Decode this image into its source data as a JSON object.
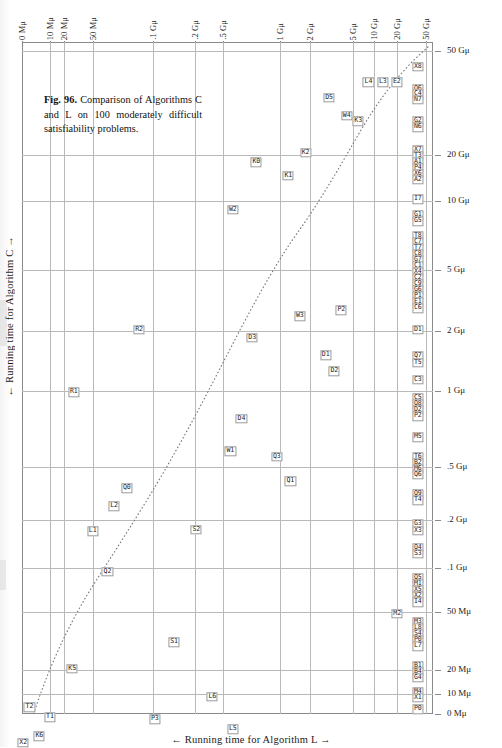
{
  "figure": {
    "caption_label": "Fig. 96.",
    "caption_text": " Comparison of Algorithms C and L on 100 moderately difficult satisfiability problems.",
    "x_axis_title": "← Running time for Algorithm L →",
    "y_axis_title": "← Running time for Algorithm C →",
    "grid": "on",
    "scale": "log-log",
    "accent_color": "#1a1a1a",
    "grid_color": "#b9b9b9"
  },
  "chart_data": {
    "type": "scatter",
    "title": "Comparison of Algorithms C and L on 100 moderately difficult satisfiability problems.",
    "xlabel": "← Running time for Algorithm L →",
    "ylabel": "← Running time for Algorithm C →",
    "xscale": "log",
    "yscale": "log",
    "xlim": [
      "0 Mμ",
      "50 Gμ"
    ],
    "ylim": [
      "0 Mμ",
      "50 Gμ"
    ],
    "x_tick_labels": [
      "0 Mμ",
      "10 Mμ",
      "20 Mμ",
      "50 Mμ",
      ".1 Gμ",
      ".2 Gμ",
      ".5 Gμ",
      "1 Gμ",
      "2 Gμ",
      "5 Gμ",
      "10 Gμ",
      "20 Gμ",
      "50 Gμ"
    ],
    "y_tick_labels": [
      "50 Gμ",
      "20 Gμ",
      "10 Gμ",
      "5 Gμ",
      "2 Gμ",
      "1 Gμ",
      ".5 Gμ",
      ".2 Gμ",
      ".1 Gμ",
      "50 Mμ",
      "20 Mμ",
      "10 Mμ",
      "0 Mμ"
    ],
    "reference_curve": "dotted diagonal trend line",
    "points": [
      {
        "label": "X8",
        "x": 0.963,
        "y": 0.037
      },
      {
        "label": "L4",
        "x": 0.843,
        "y": 0.06
      },
      {
        "label": "L3",
        "x": 0.878,
        "y": 0.06
      },
      {
        "label": "E2",
        "x": 0.912,
        "y": 0.06
      },
      {
        "label": "Q6",
        "x": 0.963,
        "y": 0.07
      },
      {
        "label": "C4",
        "x": 0.963,
        "y": 0.078
      },
      {
        "label": "N7",
        "x": 0.963,
        "y": 0.086
      },
      {
        "label": "D5",
        "x": 0.747,
        "y": 0.083
      },
      {
        "label": "W4",
        "x": 0.79,
        "y": 0.11
      },
      {
        "label": "K3",
        "x": 0.818,
        "y": 0.118
      },
      {
        "label": "G2",
        "x": 0.963,
        "y": 0.118
      },
      {
        "label": "N6",
        "x": 0.963,
        "y": 0.127
      },
      {
        "label": "X7",
        "x": 0.963,
        "y": 0.16
      },
      {
        "label": "T3",
        "x": 0.963,
        "y": 0.169
      },
      {
        "label": "A1",
        "x": 0.963,
        "y": 0.178
      },
      {
        "label": "P4",
        "x": 0.963,
        "y": 0.187
      },
      {
        "label": "X6",
        "x": 0.963,
        "y": 0.196
      },
      {
        "label": "A2",
        "x": 0.963,
        "y": 0.205
      },
      {
        "label": "K0",
        "x": 0.57,
        "y": 0.179
      },
      {
        "label": "K2",
        "x": 0.69,
        "y": 0.165
      },
      {
        "label": "K1",
        "x": 0.648,
        "y": 0.199
      },
      {
        "label": "I7",
        "x": 0.963,
        "y": 0.234
      },
      {
        "label": "W2",
        "x": 0.513,
        "y": 0.25
      },
      {
        "label": "G1",
        "x": 0.963,
        "y": 0.258
      },
      {
        "label": "G5",
        "x": 0.963,
        "y": 0.267
      },
      {
        "label": "T8",
        "x": 0.963,
        "y": 0.288
      },
      {
        "label": "C7",
        "x": 0.963,
        "y": 0.297
      },
      {
        "label": "T7",
        "x": 0.963,
        "y": 0.306
      },
      {
        "label": "C8",
        "x": 0.963,
        "y": 0.315
      },
      {
        "label": "G7",
        "x": 0.963,
        "y": 0.324
      },
      {
        "label": "C1",
        "x": 0.963,
        "y": 0.333
      },
      {
        "label": "X4",
        "x": 0.963,
        "y": 0.342
      },
      {
        "label": "C2",
        "x": 0.963,
        "y": 0.351
      },
      {
        "label": "C9",
        "x": 0.963,
        "y": 0.36
      },
      {
        "label": "G6",
        "x": 0.963,
        "y": 0.369
      },
      {
        "label": "P1",
        "x": 0.963,
        "y": 0.378
      },
      {
        "label": "E1",
        "x": 0.963,
        "y": 0.387
      },
      {
        "label": "C6",
        "x": 0.963,
        "y": 0.396
      },
      {
        "label": "W3",
        "x": 0.676,
        "y": 0.408
      },
      {
        "label": "P2",
        "x": 0.777,
        "y": 0.399
      },
      {
        "label": "R2",
        "x": 0.285,
        "y": 0.428
      },
      {
        "label": "D3",
        "x": 0.56,
        "y": 0.44
      },
      {
        "label": "D1",
        "x": 0.963,
        "y": 0.428
      },
      {
        "label": "Q7",
        "x": 0.963,
        "y": 0.468
      },
      {
        "label": "T5",
        "x": 0.963,
        "y": 0.477
      },
      {
        "label": "D1b",
        "x": 0.739,
        "y": 0.466
      },
      {
        "label": "D2",
        "x": 0.76,
        "y": 0.49
      },
      {
        "label": "C3",
        "x": 0.963,
        "y": 0.503
      },
      {
        "label": "C5",
        "x": 0.963,
        "y": 0.53
      },
      {
        "label": "Q8",
        "x": 0.963,
        "y": 0.539
      },
      {
        "label": "D2b",
        "x": 0.963,
        "y": 0.548
      },
      {
        "label": "P2b",
        "x": 0.963,
        "y": 0.557
      },
      {
        "label": "R1",
        "x": 0.126,
        "y": 0.521
      },
      {
        "label": "M5",
        "x": 0.963,
        "y": 0.588
      },
      {
        "label": "D4",
        "x": 0.534,
        "y": 0.561
      },
      {
        "label": "T6",
        "x": 0.963,
        "y": 0.617
      },
      {
        "label": "B2",
        "x": 0.963,
        "y": 0.626
      },
      {
        "label": "M6",
        "x": 0.963,
        "y": 0.635
      },
      {
        "label": "Q6b",
        "x": 0.963,
        "y": 0.644
      },
      {
        "label": "W1",
        "x": 0.507,
        "y": 0.609
      },
      {
        "label": "Q3",
        "x": 0.62,
        "y": 0.617
      },
      {
        "label": "Q9",
        "x": 0.963,
        "y": 0.673
      },
      {
        "label": "T4",
        "x": 0.963,
        "y": 0.682
      },
      {
        "label": "Q1",
        "x": 0.653,
        "y": 0.654
      },
      {
        "label": "Q0",
        "x": 0.255,
        "y": 0.664
      },
      {
        "label": "G3",
        "x": 0.963,
        "y": 0.718
      },
      {
        "label": "X3",
        "x": 0.963,
        "y": 0.727
      },
      {
        "label": "L2",
        "x": 0.224,
        "y": 0.691
      },
      {
        "label": "Q4",
        "x": 0.963,
        "y": 0.753
      },
      {
        "label": "S3",
        "x": 0.963,
        "y": 0.762
      },
      {
        "label": "L1",
        "x": 0.172,
        "y": 0.728
      },
      {
        "label": "S2",
        "x": 0.424,
        "y": 0.726
      },
      {
        "label": "Q5",
        "x": 0.963,
        "y": 0.798
      },
      {
        "label": "M1",
        "x": 0.963,
        "y": 0.807
      },
      {
        "label": "X5",
        "x": 0.963,
        "y": 0.816
      },
      {
        "label": "X2b",
        "x": 0.963,
        "y": 0.825
      },
      {
        "label": "I4",
        "x": 0.963,
        "y": 0.834
      },
      {
        "label": "Q2",
        "x": 0.208,
        "y": 0.788
      },
      {
        "label": "M3",
        "x": 0.963,
        "y": 0.863
      },
      {
        "label": "L8",
        "x": 0.963,
        "y": 0.872
      },
      {
        "label": "S4",
        "x": 0.963,
        "y": 0.881
      },
      {
        "label": "P0b",
        "x": 0.963,
        "y": 0.89
      },
      {
        "label": "L7",
        "x": 0.963,
        "y": 0.899
      },
      {
        "label": "M2",
        "x": 0.913,
        "y": 0.851
      },
      {
        "label": "B1",
        "x": 0.963,
        "y": 0.928
      },
      {
        "label": "B4",
        "x": 0.963,
        "y": 0.937
      },
      {
        "label": "G4",
        "x": 0.963,
        "y": 0.946
      },
      {
        "label": "S1",
        "x": 0.37,
        "y": 0.893
      },
      {
        "label": "M4",
        "x": 0.963,
        "y": 0.967
      },
      {
        "label": "X1",
        "x": 0.963,
        "y": 0.976
      },
      {
        "label": "K5",
        "x": 0.122,
        "y": 0.933
      },
      {
        "label": "P0",
        "x": 0.963,
        "y": 0.993
      },
      {
        "label": "L6",
        "x": 0.463,
        "y": 0.974
      },
      {
        "label": "T2",
        "x": 0.018,
        "y": 0.99
      },
      {
        "label": "T1",
        "x": 0.068,
        "y": 1.005
      },
      {
        "label": "P3",
        "x": 0.323,
        "y": 1.008
      },
      {
        "label": "L5",
        "x": 0.513,
        "y": 1.023
      },
      {
        "label": "K6",
        "x": 0.042,
        "y": 1.033
      },
      {
        "label": "X2",
        "x": 0.003,
        "y": 1.043
      }
    ]
  },
  "x_ticks": [
    {
      "label": "0 Mμ",
      "pos": 0.0
    },
    {
      "label": "10 Mμ",
      "pos": 0.068
    },
    {
      "label": "20 Mμ",
      "pos": 0.102
    },
    {
      "label": "50 Mμ",
      "pos": 0.173
    },
    {
      "label": ".1 Gμ",
      "pos": 0.318
    },
    {
      "label": ".2 Gμ",
      "pos": 0.42
    },
    {
      "label": ".5 Gμ",
      "pos": 0.488
    },
    {
      "label": "1 Gμ",
      "pos": 0.628
    },
    {
      "label": "2 Gμ",
      "pos": 0.7
    },
    {
      "label": "5 Gμ",
      "pos": 0.805
    },
    {
      "label": "10 Gμ",
      "pos": 0.857
    },
    {
      "label": "20 Gμ",
      "pos": 0.913
    },
    {
      "label": "50 Gμ",
      "pos": 0.984
    }
  ],
  "y_ticks": [
    {
      "label": "50 Gμ",
      "pos": 0.014
    },
    {
      "label": "20 Gμ",
      "pos": 0.168
    },
    {
      "label": "10 Gμ",
      "pos": 0.236
    },
    {
      "label": "5 Gμ",
      "pos": 0.34
    },
    {
      "label": "2 Gμ",
      "pos": 0.43
    },
    {
      "label": "1 Gμ",
      "pos": 0.52
    },
    {
      "label": ".5 Gμ",
      "pos": 0.632
    },
    {
      "label": ".2 Gμ",
      "pos": 0.712
    },
    {
      "label": ".1 Gμ",
      "pos": 0.782
    },
    {
      "label": "50 Mμ",
      "pos": 0.848
    },
    {
      "label": "20 Mμ",
      "pos": 0.935
    },
    {
      "label": "10 Mμ",
      "pos": 0.97
    },
    {
      "label": "0 Mμ",
      "pos": 1.0
    }
  ],
  "grid_x": [
    0.068,
    0.102,
    0.173,
    0.318,
    0.42,
    0.488,
    0.628,
    0.7,
    0.805,
    0.857,
    0.913,
    0.984
  ],
  "grid_y": [
    0.014,
    0.168,
    0.236,
    0.34,
    0.43,
    0.52,
    0.632,
    0.712,
    0.782,
    0.848,
    0.935,
    0.97
  ]
}
